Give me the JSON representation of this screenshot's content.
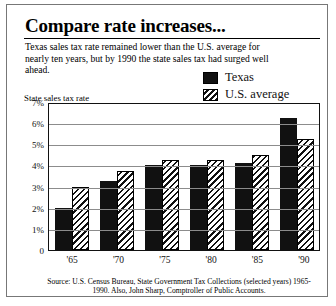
{
  "figure": {
    "title": "Compare rate increases...",
    "subtitle": "Texas sales tax rate remained lower than the U.S. average for nearly ten years, but by 1990 the state sales tax had surged well ahead.",
    "source": "Source:  U.S. Census Bureau, State Government Tax Collections (selected years) 1965-1990. Also, John Sharp, Comptroller of Public Accounts."
  },
  "colors": {
    "texas": "#111111",
    "us_average": "#ffffff",
    "gridline": "#8c8c8c",
    "axis": "#111111"
  },
  "chart_data": {
    "type": "bar",
    "title": "Compare rate increases...",
    "xlabel": "",
    "ylabel": "State sales tax rate",
    "categories": [
      "'65",
      "'70",
      "'75",
      "'80",
      "'85",
      "'90"
    ],
    "series": [
      {
        "name": "Texas",
        "values": [
          2.0,
          3.25,
          4.0,
          4.0,
          4.125,
          6.25
        ]
      },
      {
        "name": "U.S. average",
        "values": [
          3.0,
          3.75,
          4.25,
          4.25,
          4.5,
          5.25
        ]
      }
    ],
    "ylim": [
      0,
      7
    ],
    "yticks": [
      0,
      1,
      2,
      3,
      4,
      5,
      6,
      7
    ],
    "ytick_labels": [
      "0",
      "1%",
      "2%",
      "3%",
      "4%",
      "5%",
      "6%",
      "7%"
    ],
    "grid": true,
    "legend_position": "top-right",
    "legend": [
      "Texas",
      "U.S. average"
    ]
  }
}
